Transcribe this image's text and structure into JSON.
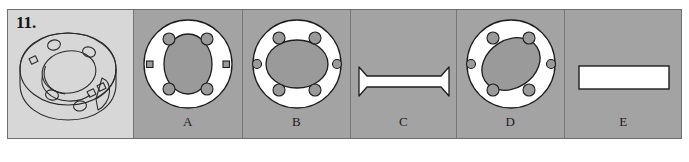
{
  "figure": {
    "question_number": "11.",
    "prompt_label": "isometric-flanged-ring-drawing",
    "background_color": "#a3a3a3",
    "prompt_background_color": "#d7d7d7",
    "shape_fill_color": "#ffffff",
    "hole_fill_color": "#9a9a9a",
    "outline_color": "#1d1d1d"
  },
  "options": [
    {
      "letter": "A",
      "shape": "annulus-4-round-holes-2-square-slots",
      "inner_shape": "tall-ellipse",
      "round_hole_count": 4,
      "square_hole_count": 2
    },
    {
      "letter": "B",
      "shape": "annulus-6-round-holes",
      "inner_shape": "wide-ellipse",
      "round_hole_count": 6,
      "square_hole_count": 0
    },
    {
      "letter": "C",
      "shape": "notched-horizontal-bar",
      "inner_shape": "none",
      "round_hole_count": 0,
      "square_hole_count": 0
    },
    {
      "letter": "D",
      "shape": "annulus-6-round-holes-tilted-bore",
      "inner_shape": "tilted-ellipse",
      "round_hole_count": 6,
      "square_hole_count": 0
    },
    {
      "letter": "E",
      "shape": "plain-rectangle",
      "inner_shape": "none",
      "round_hole_count": 0,
      "square_hole_count": 0
    }
  ]
}
